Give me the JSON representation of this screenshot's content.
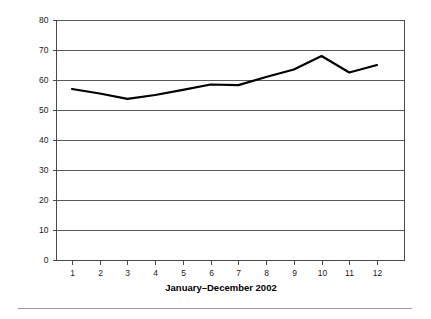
{
  "chart_data": {
    "type": "line",
    "title": "",
    "xlabel": "January–December 2002",
    "ylabel": "",
    "categories": [
      "1",
      "2",
      "3",
      "4",
      "5",
      "6",
      "7",
      "8",
      "9",
      "10",
      "11",
      "12"
    ],
    "x": [
      1,
      2,
      3,
      4,
      5,
      6,
      7,
      8,
      9,
      10,
      11,
      12
    ],
    "values": [
      57,
      55.5,
      53.7,
      55,
      56.7,
      58.5,
      58.3,
      61,
      63.5,
      68,
      62.5,
      65
    ],
    "series": [
      {
        "name": "series-1",
        "values": [
          57,
          55.5,
          53.7,
          55,
          56.7,
          58.5,
          58.3,
          61,
          63.5,
          68,
          62.5,
          65
        ],
        "color": "#000000"
      }
    ],
    "ylim": [
      0,
      80
    ],
    "xlim": [
      1,
      12
    ],
    "ytick_labels": [
      "0",
      "10",
      "20",
      "30",
      "40",
      "50",
      "60",
      "70",
      "80"
    ],
    "yticks": [
      0,
      10,
      20,
      30,
      40,
      50,
      60,
      70,
      80
    ],
    "xtick_labels": [
      "1",
      "2",
      "3",
      "4",
      "5",
      "6",
      "7",
      "8",
      "9",
      "10",
      "11",
      "12"
    ],
    "grid": true,
    "grid_axis": "y",
    "legend": false,
    "legend_position": "none",
    "grid_color": "#5a5a5a",
    "axis_color": "#4a4a4a",
    "line_color": "#000000",
    "background": "#ffffff"
  },
  "figure": {
    "footer_rule_color": "#9a9a9a"
  }
}
